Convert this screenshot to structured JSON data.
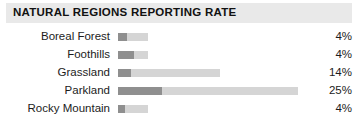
{
  "header": {
    "title": "NATURAL REGIONS REPORTING RATE",
    "band_color": "#e9e9e9"
  },
  "colors": {
    "bar_dark": "#8f8f8f",
    "bar_light": "#d5d5d5",
    "text": "#1c1c1c",
    "background": "#ffffff"
  },
  "chart_data": {
    "type": "bar",
    "title": "NATURAL REGIONS REPORTING RATE",
    "xlabel": "",
    "ylabel": "",
    "orientation": "horizontal",
    "grid": false,
    "legend": null,
    "value_suffix": "%",
    "categories": [
      "Boreal Forest",
      "Foothills",
      "Grassland",
      "Parkland",
      "Rocky Mountain"
    ],
    "values": [
      4,
      4,
      14,
      25,
      4
    ],
    "value_labels": [
      "4%",
      "4%",
      "14%",
      "25%",
      "4%"
    ],
    "series": [
      {
        "name": "Reporting rate",
        "values": [
          4,
          4,
          14,
          25,
          4
        ]
      }
    ],
    "rows": [
      {
        "label": "Boreal Forest",
        "value": 4,
        "value_label": "4%",
        "bar_total_px": 30,
        "bar_dark_px": 9
      },
      {
        "label": "Foothills",
        "value": 4,
        "value_label": "4%",
        "bar_total_px": 30,
        "bar_dark_px": 16
      },
      {
        "label": "Grassland",
        "value": 14,
        "value_label": "14%",
        "bar_total_px": 102,
        "bar_dark_px": 13
      },
      {
        "label": "Parkland",
        "value": 25,
        "value_label": "25%",
        "bar_total_px": 180,
        "bar_dark_px": 44
      },
      {
        "label": "Rocky Mountain",
        "value": 4,
        "value_label": "4%",
        "bar_total_px": 30,
        "bar_dark_px": 7
      }
    ]
  }
}
